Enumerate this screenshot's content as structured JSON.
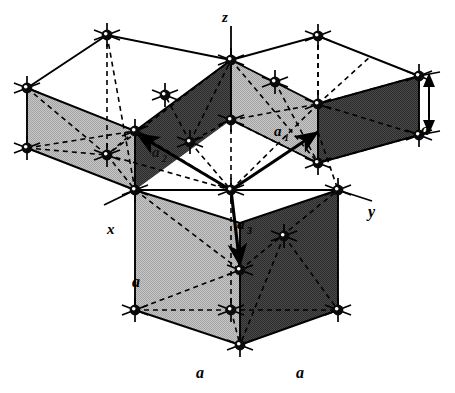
{
  "figure": {
    "kind": "crystal-lattice-diagram",
    "colors": {
      "background": "#ffffff",
      "line": "#000000",
      "face_light": "#b9b9b9",
      "face_dark": "#3c3c3c",
      "face_white": "#ffffff",
      "atom_fill": "#0a0a0a",
      "atom_highlight": "#ffffff"
    }
  },
  "axes": {
    "z": {
      "label": "z",
      "x": 222,
      "y": 16
    },
    "x": {
      "label": "x",
      "x": 113,
      "y": 228
    },
    "y": {
      "label": "y",
      "x": 371,
      "y": 211
    }
  },
  "vectors": [
    {
      "name": "a1",
      "label": "a",
      "sub": "1",
      "lx": 280,
      "ly": 131,
      "x1": 231,
      "y1": 190,
      "x2": 318,
      "y2": 132
    },
    {
      "name": "a2",
      "label": "a",
      "sub": "2",
      "lx": 158,
      "ly": 152,
      "x1": 231,
      "y1": 190,
      "x2": 135,
      "y2": 131
    },
    {
      "name": "a3",
      "label": "a",
      "sub": "3",
      "lx": 243,
      "ly": 224,
      "x1": 231,
      "y1": 190,
      "x2": 240,
      "y2": 270
    }
  ],
  "dimensions": [
    {
      "name": "a-right",
      "label": "a",
      "x": 425,
      "y": 129
    },
    {
      "name": "a-left",
      "label": "a",
      "x": 136,
      "y": 281
    },
    {
      "name": "a-bottom-left",
      "label": "a",
      "x": 200,
      "y": 372
    },
    {
      "name": "a-bottom-right",
      "label": "a",
      "x": 300,
      "y": 372
    }
  ],
  "dimension_arrow": {
    "name": "a-height-arrow",
    "x": 401,
    "y_top": 72,
    "y_bottom": 188
  }
}
